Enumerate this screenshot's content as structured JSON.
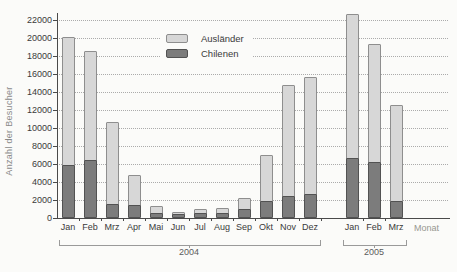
{
  "chart_data": {
    "type": "bar",
    "stacked": true,
    "title": "",
    "ylabel": "Anzahl der Besucher",
    "xlabel": "Monat",
    "ylim": [
      0,
      22000
    ],
    "ytick_step": 2000,
    "yticks": [
      0,
      2000,
      4000,
      6000,
      8000,
      10000,
      12000,
      14000,
      16000,
      18000,
      20000,
      22000
    ],
    "grid": "horizontal-dotted",
    "categories": [
      "Jan",
      "Feb",
      "Mrz",
      "Apr",
      "Mai",
      "Jun",
      "Jul",
      "Aug",
      "Sep",
      "Okt",
      "Nov",
      "Dez",
      "Jan",
      "Feb",
      "Mrz"
    ],
    "groups": [
      {
        "label": "2004",
        "count": 12
      },
      {
        "label": "2005",
        "count": 3
      }
    ],
    "series": [
      {
        "name": "Chilenen",
        "color": "#7c7c7c",
        "border_color": "#525252",
        "values": [
          5900,
          6400,
          1600,
          1400,
          600,
          400,
          600,
          600,
          1000,
          1900,
          2400,
          2700,
          6700,
          6200,
          1900
        ]
      },
      {
        "name": "Ausländer",
        "color": "#d7d7d7",
        "border_color": "#8e8e8e",
        "values": [
          14200,
          12200,
          9100,
          3400,
          700,
          300,
          400,
          500,
          1200,
          5100,
          12400,
          13000,
          16000,
          13100,
          10700
        ]
      }
    ],
    "totals": [
      20100,
      18600,
      10700,
      4800,
      1300,
      700,
      1000,
      1100,
      2200,
      7000,
      14800,
      15700,
      22700,
      19300,
      12600
    ],
    "legend": {
      "position": "top-center",
      "entries": [
        "Ausländer",
        "Chilenen"
      ]
    }
  }
}
